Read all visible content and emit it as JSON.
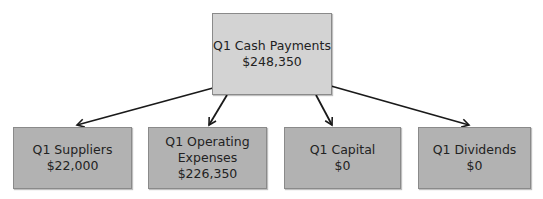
{
  "diagram": {
    "root": {
      "label": "Q1 Cash Payments",
      "value": "$248,350"
    },
    "children": [
      {
        "label": "Q1 Suppliers",
        "value": "$22,000"
      },
      {
        "label": "Q1 Operating Expenses",
        "label_lines": [
          "Q1 Operating",
          "Expenses"
        ],
        "value": "$226,350"
      },
      {
        "label": "Q1 Capital",
        "value": "$0"
      },
      {
        "label": "Q1 Dividends",
        "value": "$0"
      }
    ],
    "edges": [
      {
        "from": "Q1 Cash Payments",
        "to": "Q1 Suppliers"
      },
      {
        "from": "Q1 Cash Payments",
        "to": "Q1 Operating Expenses"
      },
      {
        "from": "Q1 Cash Payments",
        "to": "Q1 Capital"
      },
      {
        "from": "Q1 Cash Payments",
        "to": "Q1 Dividends"
      }
    ],
    "colors": {
      "root_fill": "#d3d3d3",
      "child_fill": "#b2b2b2",
      "arrow": "#1a1a1a"
    }
  }
}
